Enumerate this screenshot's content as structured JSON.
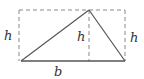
{
  "diagram": {
    "labels": {
      "left_height": "h",
      "center_height": "h",
      "right_height": "h",
      "base": "b"
    },
    "colors": {
      "solid_line": "#555555",
      "dashed_line": "#888888",
      "text": "#333333"
    },
    "geometry": {
      "rectangle": {
        "x": 19,
        "y": 10,
        "width": 106,
        "height": 51
      },
      "triangle": {
        "apex": [
          89,
          10
        ],
        "base_left": [
          21,
          61
        ],
        "base_right": [
          125,
          61
        ]
      },
      "altitude_x": 89
    }
  }
}
